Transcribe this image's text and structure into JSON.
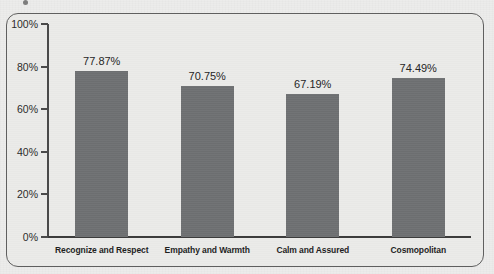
{
  "chart_data": {
    "type": "bar",
    "title": "",
    "xlabel": "",
    "ylabel": "",
    "categories": [
      "Recognize and Respect",
      "Empathy and Warmth",
      "Calm and Assured",
      "Cosmopolitan"
    ],
    "values": [
      77.87,
      70.75,
      67.19,
      74.49
    ],
    "value_labels": [
      "77.87%",
      "70.75%",
      "67.19%",
      "74.49%"
    ],
    "ylim": [
      0,
      100
    ],
    "ytick_values": [
      100,
      80,
      60,
      40,
      20,
      0
    ],
    "ytick_labels": [
      "100%",
      "80%",
      "60%",
      "40%",
      "20%",
      "0%"
    ],
    "grid": false,
    "legend": false,
    "legend_position": "none",
    "series": [
      {
        "name": "Percentage",
        "values": [
          77.87,
          70.75,
          67.19,
          74.49
        ]
      }
    ],
    "colors": {
      "bar": "#6f7173",
      "background": "#ebebe9",
      "axis": "#4a4a4a",
      "text": "#262626",
      "frame_border": "#5f5f5f"
    }
  }
}
